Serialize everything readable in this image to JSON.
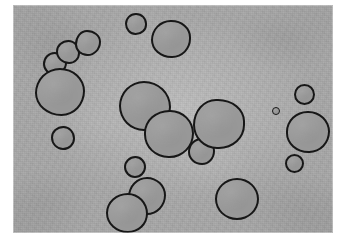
{
  "image": {
    "kind": "grayscale-micrograph",
    "caption": "Grayscale micrograph showing dark-outlined rounded droplets dispersed on a mottled gray field",
    "width": 337,
    "height": 245,
    "plate": {
      "left": 13,
      "top": 5,
      "width": 320,
      "height": 228
    },
    "colors": {
      "paper": "#ffffff",
      "background_field": "#a7a7a7",
      "background_center_highlight": "#b2b2b2",
      "background_corner_shadow": "#949494",
      "droplet_fill": "#9c9c9c",
      "droplet_outline": "#171717"
    }
  },
  "droplets": [
    {
      "id": "droplet-01",
      "label": "small upper-left-upper",
      "x": 30,
      "y": 47,
      "w": 24,
      "h": 23,
      "radii": "48% 52% 55% 45% / 52% 48% 52% 48%"
    },
    {
      "id": "droplet-02",
      "label": "small upper-left-mid",
      "x": 43,
      "y": 35,
      "w": 24,
      "h": 24,
      "radii": "52% 48% 45% 55% / 48% 55% 45% 52%"
    },
    {
      "id": "droplet-03",
      "label": "small upper-left-top",
      "x": 62,
      "y": 25,
      "w": 26,
      "h": 26,
      "radii": "46% 54% 52% 48% / 55% 45% 55% 45%"
    },
    {
      "id": "droplet-04",
      "label": "large upper-left",
      "x": 22,
      "y": 63,
      "w": 50,
      "h": 48,
      "radii": "50% 50% 47% 53% / 52% 48% 52% 48%"
    },
    {
      "id": "droplet-05",
      "label": "small left-lower",
      "x": 38,
      "y": 121,
      "w": 24,
      "h": 24,
      "radii": "52% 48% 50% 50% / 48% 52% 48% 52%"
    },
    {
      "id": "droplet-06",
      "label": "small top-center",
      "x": 112,
      "y": 8,
      "w": 22,
      "h": 22,
      "radii": "50% 50% 52% 48% / 50% 50% 48% 52%"
    },
    {
      "id": "droplet-07",
      "label": "medium top-center",
      "x": 138,
      "y": 15,
      "w": 40,
      "h": 38,
      "radii": "50% 50% 48% 52% / 54% 46% 52% 48%"
    },
    {
      "id": "droplet-08",
      "label": "large center-upper",
      "x": 106,
      "y": 76,
      "w": 52,
      "h": 50,
      "radii": "48% 52% 52% 48% / 50% 52% 48% 50%"
    },
    {
      "id": "droplet-09",
      "label": "large center",
      "x": 131,
      "y": 105,
      "w": 50,
      "h": 48,
      "radii": "52% 48% 50% 50% / 48% 50% 52% 50%"
    },
    {
      "id": "droplet-10",
      "label": "small center-right",
      "x": 175,
      "y": 133,
      "w": 27,
      "h": 27,
      "radii": "50% 50% 48% 52% / 52% 48% 52% 48%"
    },
    {
      "id": "droplet-11",
      "label": "large right-of-center",
      "x": 180,
      "y": 94,
      "w": 52,
      "h": 50,
      "radii": "46% 54% 52% 48% / 54% 46% 50% 50%"
    },
    {
      "id": "droplet-12",
      "label": "small upper-right",
      "x": 281,
      "y": 79,
      "w": 21,
      "h": 21,
      "radii": "50% 50% 50% 50% / 50% 50% 50% 50%"
    },
    {
      "id": "droplet-13",
      "label": "dot right",
      "x": 259,
      "y": 102,
      "w": 8,
      "h": 8,
      "radii": "50%"
    },
    {
      "id": "droplet-14",
      "label": "large right",
      "x": 273,
      "y": 106,
      "w": 44,
      "h": 42,
      "radii": "50% 50% 48% 52% / 50% 50% 52% 48%"
    },
    {
      "id": "droplet-15",
      "label": "small lower-right",
      "x": 272,
      "y": 149,
      "w": 19,
      "h": 19,
      "radii": "50%"
    },
    {
      "id": "droplet-16",
      "label": "small lower-center",
      "x": 111,
      "y": 151,
      "w": 22,
      "h": 22,
      "radii": "52% 48% 50% 50% / 50% 50% 50% 50%"
    },
    {
      "id": "droplet-17",
      "label": "medium bottom-center",
      "x": 115,
      "y": 172,
      "w": 38,
      "h": 38,
      "radii": "50% 50% 50% 50% / 52% 48% 52% 48%"
    },
    {
      "id": "droplet-18",
      "label": "medium bottom-left",
      "x": 93,
      "y": 188,
      "w": 42,
      "h": 40,
      "radii": "52% 48% 48% 52% / 50% 52% 48% 50%"
    },
    {
      "id": "droplet-19",
      "label": "large bottom-right",
      "x": 202,
      "y": 173,
      "w": 44,
      "h": 42,
      "radii": "50% 50% 50% 50% / 50% 50% 50% 50%"
    }
  ]
}
